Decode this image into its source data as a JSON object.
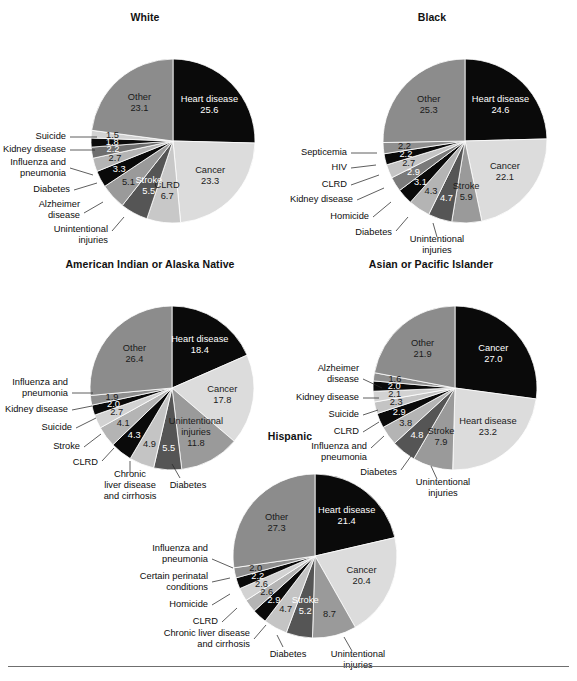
{
  "figure": {
    "panels": [
      {
        "id": "white",
        "title": "White",
        "chart_data": {
          "type": "pie",
          "title": "White",
          "unit": "percent of total deaths",
          "start_angle_deg": 0,
          "direction": "clockwise",
          "labels": [
            "Heart disease",
            "Cancer",
            "CLRD",
            "Stroke",
            "Unintentional injuries",
            "Alzheimer disease",
            "Diabetes",
            "Influenza and pneumonia",
            "Kidney disease",
            "Suicide",
            "Other"
          ],
          "values": [
            25.6,
            23.3,
            6.7,
            5.5,
            5.1,
            3.3,
            2.7,
            2.2,
            1.8,
            1.5,
            23.1
          ],
          "colors": [
            "#0a0a0a",
            "#dcdcdc",
            "#c8c8c8",
            "#555555",
            "#9a9a9a",
            "#0a0a0a",
            "#b4b4b4",
            "#6e6e6e",
            "#0a0a0a",
            "#d2d2d2",
            "#8c8c8c"
          ]
        }
      },
      {
        "id": "black",
        "title": "Black",
        "chart_data": {
          "type": "pie",
          "title": "Black",
          "unit": "percent of total deaths",
          "start_angle_deg": 0,
          "direction": "clockwise",
          "labels": [
            "Heart disease",
            "Cancer",
            "Stroke",
            "Unintentional injuries",
            "Diabetes",
            "Homicide",
            "Kidney disease",
            "CLRD",
            "HIV",
            "Septicemia",
            "Other"
          ],
          "values": [
            24.6,
            22.1,
            5.9,
            4.7,
            4.3,
            3.1,
            2.9,
            2.7,
            2.2,
            2.2,
            25.3
          ],
          "colors": [
            "#0a0a0a",
            "#dcdcdc",
            "#9a9a9a",
            "#555555",
            "#b4b4b4",
            "#0a0a0a",
            "#7a7a7a",
            "#c4c4c4",
            "#0a0a0a",
            "#8f8f8f",
            "#8c8c8c"
          ]
        }
      },
      {
        "id": "american-indian-or-alaska-native",
        "title": "American Indian or Alaska Native",
        "chart_data": {
          "type": "pie",
          "title": "American Indian or Alaska Native",
          "unit": "percent of total deaths",
          "start_angle_deg": 0,
          "direction": "clockwise",
          "labels": [
            "Heart disease",
            "Cancer",
            "Unintentional injuries",
            "Diabetes",
            "Chronic liver disease and cirrhosis",
            "CLRD",
            "Stroke",
            "Suicide",
            "Kidney disease",
            "Influenza and pneumonia",
            "Other"
          ],
          "values": [
            18.4,
            17.8,
            11.8,
            5.5,
            4.9,
            4.3,
            4.1,
            2.7,
            2.0,
            1.9,
            26.4
          ],
          "colors": [
            "#0a0a0a",
            "#dcdcdc",
            "#9a9a9a",
            "#555555",
            "#c4c4c4",
            "#0a0a0a",
            "#b4b4b4",
            "#d2d2d2",
            "#0a0a0a",
            "#8f8f8f",
            "#8c8c8c"
          ]
        }
      },
      {
        "id": "asian-or-pacific-islander",
        "title": "Asian or Pacific Islander",
        "chart_data": {
          "type": "pie",
          "title": "Asian or Pacific Islander",
          "unit": "percent of total deaths",
          "start_angle_deg": 0,
          "direction": "clockwise",
          "labels": [
            "Cancer",
            "Heart disease",
            "Stroke",
            "Unintentional injuries",
            "Diabetes",
            "Influenza and pneumonia",
            "CLRD",
            "Suicide",
            "Kidney disease",
            "Alzheimer disease",
            "Other"
          ],
          "values": [
            27.0,
            23.2,
            7.9,
            4.8,
            3.8,
            2.9,
            2.3,
            2.1,
            2.0,
            1.6,
            21.9
          ],
          "colors": [
            "#0a0a0a",
            "#dcdcdc",
            "#9a9a9a",
            "#555555",
            "#b4b4b4",
            "#0a0a0a",
            "#c4c4c4",
            "#d2d2d2",
            "#0a0a0a",
            "#8f8f8f",
            "#8c8c8c"
          ]
        }
      },
      {
        "id": "hispanic",
        "title": "Hispanic",
        "chart_data": {
          "type": "pie",
          "title": "Hispanic",
          "unit": "percent of total deaths",
          "start_angle_deg": 0,
          "direction": "clockwise",
          "labels": [
            "Heart disease",
            "Cancer",
            "Unintentional injuries",
            "Stroke",
            "Diabetes",
            "Chronic liver disease and cirrhosis",
            "CLRD",
            "Homicide",
            "Certain perinatal conditions",
            "Influenza and pneumonia",
            "Other"
          ],
          "values": [
            21.4,
            20.4,
            8.7,
            5.2,
            4.7,
            2.9,
            2.6,
            2.6,
            2.2,
            2.0,
            27.3
          ],
          "colors": [
            "#0a0a0a",
            "#dcdcdc",
            "#9a9a9a",
            "#555555",
            "#c4c4c4",
            "#0a0a0a",
            "#b4b4b4",
            "#d2d2d2",
            "#0a0a0a",
            "#8f8f8f",
            "#8c8c8c"
          ]
        }
      }
    ]
  }
}
